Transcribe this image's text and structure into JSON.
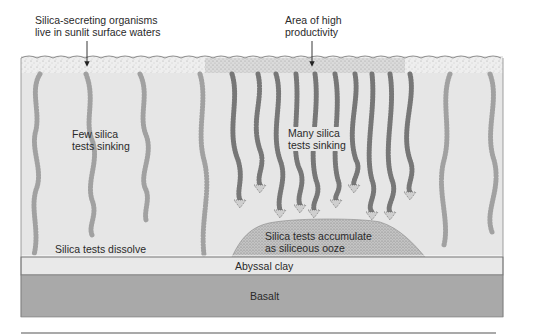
{
  "diagram": {
    "callouts": {
      "surface": {
        "line1": "Silica-secreting organisms",
        "line2": "live in sunlit surface waters"
      },
      "productivity": {
        "line1": "Area of high",
        "line2": "productivity"
      }
    },
    "water_labels": {
      "few": {
        "line1": "Few silica",
        "line2": "tests sinking"
      },
      "many": {
        "line1": "Many silica",
        "line2": "tests sinking"
      },
      "dissolve": "Silica tests dissolve",
      "accumulate": {
        "line1": "Silica tests accumulate",
        "line2": "as siliceous ooze"
      }
    },
    "layers": {
      "clay": "Abyssal clay",
      "basalt": "Basalt"
    },
    "colors": {
      "water": "#e6e6e6",
      "surface": "#efefef",
      "clay": "#e9e9e9",
      "basalt": "#a9a9a9",
      "ooze": "#bdbdbd",
      "outline": "#555555"
    }
  }
}
